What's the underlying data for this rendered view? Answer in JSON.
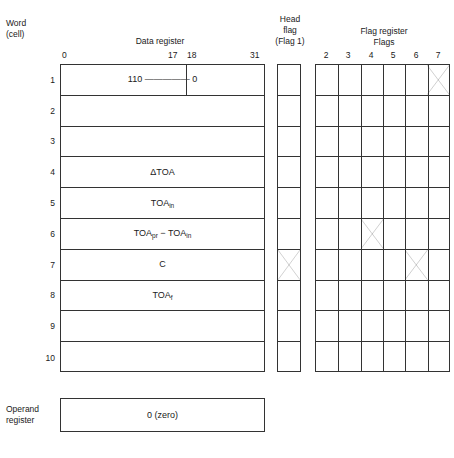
{
  "diagram": {
    "captions": {
      "word_cell": "Word\n(cell)",
      "word_line1": "Word",
      "word_line2": "(cell)",
      "data_register": "Data register",
      "head_flag_line1": "Head",
      "head_flag_line2": "flag",
      "head_flag_line3": "(Flag 1)",
      "flag_register_line1": "Flag register",
      "flag_register_line2": "Flags",
      "operand_line1": "Operand",
      "operand_line2": "register"
    },
    "data_register": {
      "bit_ticks": [
        "0",
        "17",
        "18",
        "31"
      ],
      "split_after_bit": "17",
      "word_numbers": [
        "1",
        "2",
        "3",
        "4",
        "5",
        "6",
        "7",
        "8",
        "9",
        "10"
      ],
      "rows": [
        {
          "word": "1",
          "content": "110 ————— 0",
          "content_base": "110 ————— 0",
          "subscript": "",
          "has_bit_split": true
        },
        {
          "word": "2",
          "content": "",
          "content_base": "",
          "subscript": "",
          "has_bit_split": false
        },
        {
          "word": "3",
          "content": "",
          "content_base": "",
          "subscript": "",
          "has_bit_split": false
        },
        {
          "word": "4",
          "content": "ΔTOA",
          "content_base": "ΔTOA",
          "subscript": "",
          "has_bit_split": false
        },
        {
          "word": "5",
          "content": "TOAin",
          "content_base": "TOA",
          "subscript": "in",
          "has_bit_split": false
        },
        {
          "word": "6",
          "content": "TOApr − TOAin",
          "content_base": "TOA",
          "subscript": "pr",
          "content_base2": " − TOA",
          "subscript2": "in",
          "has_bit_split": false
        },
        {
          "word": "7",
          "content": "C",
          "content_base": "C",
          "subscript": "",
          "has_bit_split": false
        },
        {
          "word": "8",
          "content": "TOAf",
          "content_base": "TOA",
          "subscript": "f",
          "has_bit_split": false
        },
        {
          "word": "9",
          "content": "",
          "content_base": "",
          "subscript": "",
          "has_bit_split": false
        },
        {
          "word": "10",
          "content": "",
          "content_base": "",
          "subscript": "",
          "has_bit_split": false
        }
      ]
    },
    "head_flag": {
      "row_count": 10,
      "marked_rows": [
        7
      ]
    },
    "flag_register": {
      "column_labels": [
        "2",
        "3",
        "4",
        "5",
        "6",
        "7"
      ],
      "row_count": 10,
      "marks": [
        {
          "row": 1,
          "column": "7"
        },
        {
          "row": 6,
          "column": "4"
        },
        {
          "row": 7,
          "column": "6"
        }
      ]
    },
    "operand_register": {
      "value": "0 (zero)"
    },
    "colors": {
      "line": "#333333",
      "text": "#1a1a1a",
      "background": "#ffffff"
    }
  }
}
